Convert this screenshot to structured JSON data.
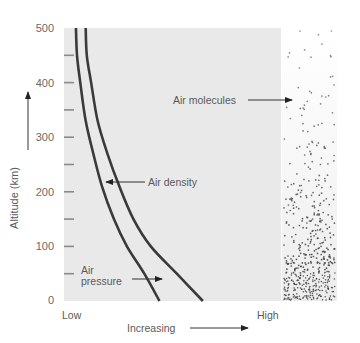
{
  "chart_data": {
    "type": "line",
    "title": "",
    "xlabel": "Increasing",
    "ylabel": "Altitude (km)",
    "ylim": [
      0,
      500
    ],
    "x_tick_labels": [
      "Low",
      "High"
    ],
    "y_ticks": [
      0,
      100,
      200,
      300,
      400,
      500
    ],
    "y_minor_ticks": [
      50,
      150,
      250,
      350,
      450
    ],
    "grid": false,
    "legend": null,
    "series": [
      {
        "name": "Air pressure",
        "x_relative_0_to_1": [
          0.055,
          0.06,
          0.075,
          0.1,
          0.135,
          0.175,
          0.23,
          0.29,
          0.37,
          0.44
        ],
        "altitude_km": [
          500,
          450,
          400,
          330,
          270,
          210,
          150,
          100,
          50,
          0
        ]
      },
      {
        "name": "Air density",
        "x_relative_0_to_1": [
          0.1,
          0.105,
          0.125,
          0.155,
          0.2,
          0.255,
          0.32,
          0.4,
          0.52,
          0.64
        ],
        "altitude_km": [
          500,
          450,
          400,
          330,
          270,
          210,
          150,
          100,
          50,
          0
        ]
      }
    ],
    "annotations": [
      {
        "text": "Air density",
        "points_to": "Air density curve at ~215 km"
      },
      {
        "text": "Air pressure",
        "points_to": "Air pressure curve at ~40 km"
      },
      {
        "text": "Air molecules",
        "points_to": "molecule dot panel at ~400 km"
      }
    ],
    "side_panel": {
      "description": "Dot density of air molecules increasing toward the surface",
      "density_trend": "exponential increase toward 0 km"
    }
  },
  "labels": {
    "y_axis": "Altitude (km)",
    "x_low": "Low",
    "x_high": "High",
    "x_increasing": "Increasing",
    "air_density": "Air density",
    "air_pressure_line1": "Air",
    "air_pressure_line2": "pressure",
    "air_molecules": "Air molecules",
    "y_tick_labels": [
      "500",
      "400",
      "300",
      "200",
      "100",
      "0"
    ]
  },
  "colors": {
    "plot_background": "#e9e9e9",
    "curve": "#3a3a3a",
    "tick": "#8a8a8a",
    "text": "#5a5a5a",
    "dots": "#444444"
  }
}
